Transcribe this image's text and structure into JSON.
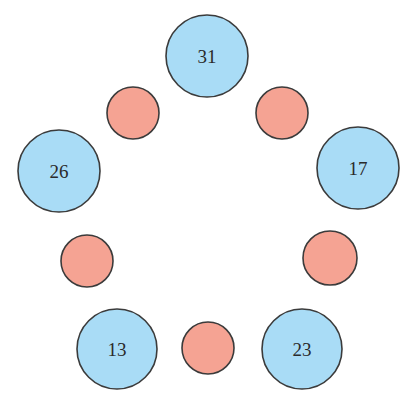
{
  "diagram": {
    "type": "circle-ring-puzzle",
    "colors": {
      "blue_fill": "#a9dcf6",
      "red_fill": "#f5a393",
      "stroke": "#3b3b3b",
      "label": "#2a2a2a"
    },
    "blue_circles": [
      {
        "id": "top",
        "label": "31",
        "cx": 207,
        "cy": 56,
        "r": 41
      },
      {
        "id": "left",
        "label": "26",
        "cx": 59,
        "cy": 171,
        "r": 41
      },
      {
        "id": "right",
        "label": "17",
        "cx": 358,
        "cy": 168,
        "r": 41
      },
      {
        "id": "bottom-left",
        "label": "13",
        "cx": 117,
        "cy": 349,
        "r": 40
      },
      {
        "id": "bottom-right",
        "label": "23",
        "cx": 302,
        "cy": 349,
        "r": 40
      }
    ],
    "red_circles": [
      {
        "id": "top-left",
        "cx": 133,
        "cy": 113,
        "r": 26
      },
      {
        "id": "top-right",
        "cx": 282,
        "cy": 113,
        "r": 26
      },
      {
        "id": "mid-left",
        "cx": 87,
        "cy": 261,
        "r": 26
      },
      {
        "id": "mid-right",
        "cx": 330,
        "cy": 258,
        "r": 27
      },
      {
        "id": "bottom",
        "cx": 208,
        "cy": 348,
        "r": 26
      }
    ]
  }
}
